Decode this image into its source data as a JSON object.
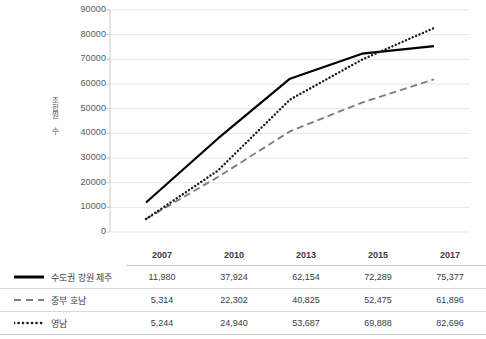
{
  "chart_data": {
    "type": "line",
    "title": "",
    "xlabel": "",
    "ylabel": "조합원 수",
    "categories": [
      "2007",
      "2010",
      "2013",
      "2015",
      "2017"
    ],
    "ylim": [
      0,
      90000
    ],
    "ytick_step": 10000,
    "yticks": [
      "0",
      "10000",
      "20000",
      "30000",
      "40000",
      "50000",
      "60000",
      "70000",
      "80000",
      "90000"
    ],
    "grid": "horizontal",
    "legend_position": "table-left",
    "series": [
      {
        "name": "수도권 강원 제주",
        "style": "solid",
        "color": "#000000",
        "values": [
          11980,
          37924,
          62154,
          72289,
          75377
        ],
        "labels": [
          "11,980",
          "37,924",
          "62,154",
          "72,289",
          "75,377"
        ]
      },
      {
        "name": "중부 호남",
        "style": "dashed",
        "color": "#7f7f7f",
        "values": [
          5314,
          22302,
          40825,
          52475,
          61896
        ],
        "labels": [
          "5,314",
          "22,302",
          "40,825",
          "52,475",
          "61,896"
        ]
      },
      {
        "name": "영남",
        "style": "dotted",
        "color": "#1a1a1a",
        "values": [
          5244,
          24940,
          53687,
          69888,
          82696
        ],
        "labels": [
          "5,244",
          "24,940",
          "53,687",
          "69,888",
          "82,696"
        ]
      }
    ]
  },
  "table": {
    "corner_label": "",
    "headers": [
      "2007",
      "2010",
      "2013",
      "2015",
      "2017"
    ],
    "rows": [
      {
        "legend": "수도권 강원 제주",
        "values": [
          "11,980",
          "37,924",
          "62,154",
          "72,289",
          "75,377"
        ]
      },
      {
        "legend": "중부 호남",
        "values": [
          "5,314",
          "22,302",
          "40,825",
          "52,475",
          "61,896"
        ]
      },
      {
        "legend": "영남",
        "values": [
          "5,244",
          "24,940",
          "53,687",
          "69,888",
          "82,696"
        ]
      }
    ]
  },
  "colors": {
    "gridline": "#e6e6e6",
    "axis": "#c9c9c9",
    "series_solid": "#000000",
    "series_dashed": "#7f7f7f",
    "series_dotted": "#1a1a1a",
    "text": "#3b3b3b"
  }
}
